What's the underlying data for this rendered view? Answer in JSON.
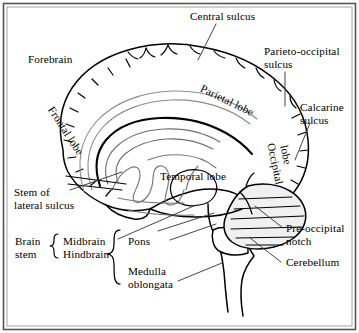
{
  "figure": {
    "border_color": "#444444",
    "line_color": "#000000",
    "faint_line_color": "#b9b9b9",
    "inner_line_color": "#7b7b7b",
    "shade_color": "#f1f1f1",
    "background": "#ffffff"
  },
  "labels": {
    "forebrain": "Forebrain",
    "central_sulcus": "Central sulcus",
    "parieto_occipital_sulcus_line1": "Parieto-occipital",
    "parieto_occipital_sulcus_line2": "sulcus",
    "calcarine_sulcus_line1": "Calcarine",
    "calcarine_sulcus_line2": "sulcus",
    "frontal_lobe": "Frontal lobe",
    "parietal_lobe": "Parietal lobe",
    "occipital_lobe_line1": "Occipital",
    "occipital_lobe_line2": "lobe",
    "temporal_lobe": "Temporal lobe",
    "stem_of_lateral_sulcus_line1": "Stem of",
    "stem_of_lateral_sulcus_line2": "lateral sulcus",
    "brain_stem_line1": "Brain",
    "brain_stem_line2": "stem",
    "midbrain": "Midbrain",
    "hindbrain": "Hindbrain",
    "pons": "Pons",
    "medulla_line1": "Medulla",
    "medulla_line2": "oblongata",
    "pre_occipital_notch_line1": "Pre-occipital",
    "pre_occipital_notch_line2": "notch",
    "cerebellum": "Cerebellum"
  },
  "structures": [
    "cerebral hemisphere outline",
    "corpus callosum",
    "lateral ventricle",
    "thalamus",
    "midbrain",
    "pons",
    "medulla oblongata",
    "cerebellum",
    "spinal cord"
  ]
}
